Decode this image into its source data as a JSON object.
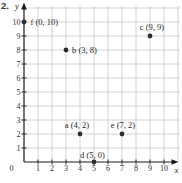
{
  "problem_number": "2.",
  "chart_data": {
    "type": "scatter",
    "title": "",
    "xlabel": "x",
    "ylabel": "y",
    "xlim": [
      0,
      10
    ],
    "ylim": [
      0,
      10
    ],
    "grid": true,
    "x_ticks": [
      0,
      1,
      2,
      3,
      4,
      5,
      6,
      7,
      8,
      9,
      10
    ],
    "y_ticks": [
      1,
      2,
      3,
      4,
      5,
      6,
      7,
      8,
      9,
      10
    ],
    "points": [
      {
        "name": "f",
        "x": 0,
        "y": 10,
        "label": "f (0, 10)",
        "label_pos": "right"
      },
      {
        "name": "b",
        "x": 3,
        "y": 8,
        "label": "b (3, 8)",
        "label_pos": "right"
      },
      {
        "name": "c",
        "x": 9,
        "y": 9,
        "label": "c (9, 9)",
        "label_pos": "above"
      },
      {
        "name": "a",
        "x": 4,
        "y": 2,
        "label": "a (4, 2)",
        "label_pos": "above"
      },
      {
        "name": "e",
        "x": 7,
        "y": 2,
        "label": "e (7, 2)",
        "label_pos": "above"
      },
      {
        "name": "d",
        "x": 5,
        "y": 0,
        "label": "d (5, 0)",
        "label_pos": "above"
      }
    ],
    "colors": {
      "point": "#2e2e2e",
      "grid": "#c9c9c9",
      "axis": "#1a1a1a",
      "text": "#1f1f1f"
    }
  }
}
